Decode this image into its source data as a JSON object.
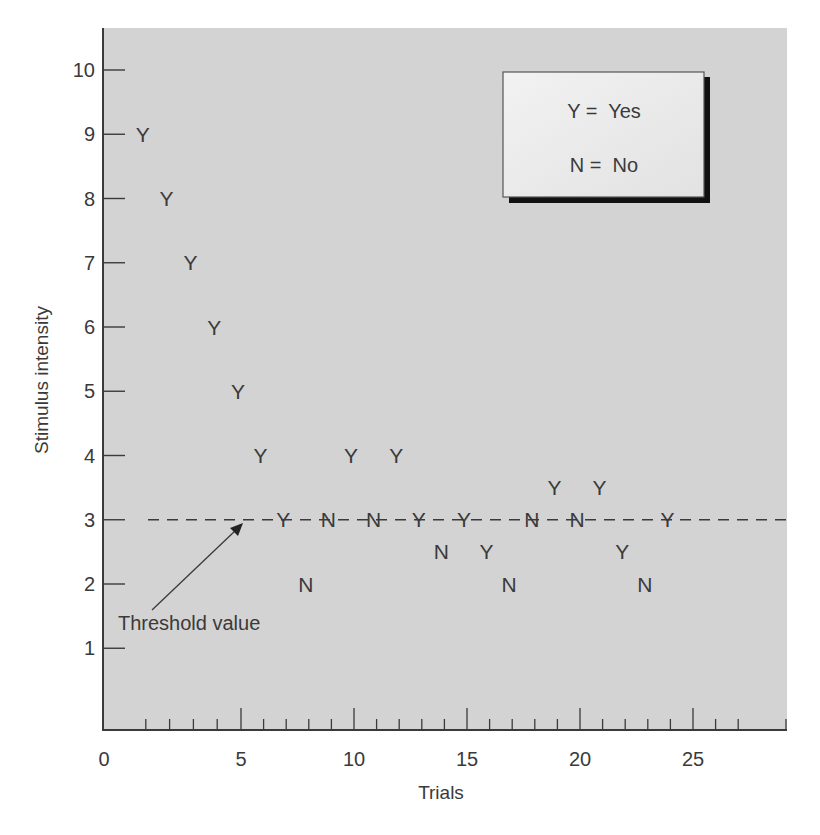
{
  "chart_data": {
    "type": "scatter",
    "title": "",
    "xlabel": "Trials",
    "ylabel": "Stimulus intensity",
    "xlim": [
      0,
      28
    ],
    "ylim": [
      0,
      10.6
    ],
    "grid": false,
    "x_major_ticks": [
      0,
      5,
      10,
      15,
      20,
      25
    ],
    "x_tick_labels": [
      "0",
      "5",
      "10",
      "15",
      "20",
      "25"
    ],
    "y_ticks": [
      1,
      2,
      3,
      4,
      5,
      6,
      7,
      8,
      9,
      10
    ],
    "y_tick_labels": [
      "1",
      "2",
      "3",
      "4",
      "5",
      "6",
      "7",
      "8",
      "9",
      "10"
    ],
    "legend": {
      "position": "upper right",
      "entries": [
        {
          "symbol": "Y",
          "text": "Y =  Yes"
        },
        {
          "symbol": "N",
          "text": "N =  No"
        }
      ]
    },
    "threshold": {
      "value": 3,
      "style": "dashed",
      "label": "Threshold value"
    },
    "points": [
      {
        "trial": 1,
        "intensity": 9,
        "response": "Y"
      },
      {
        "trial": 2,
        "intensity": 8,
        "response": "Y"
      },
      {
        "trial": 3,
        "intensity": 7,
        "response": "Y"
      },
      {
        "trial": 4,
        "intensity": 6,
        "response": "Y"
      },
      {
        "trial": 5,
        "intensity": 5,
        "response": "Y"
      },
      {
        "trial": 6,
        "intensity": 4,
        "response": "Y"
      },
      {
        "trial": 7,
        "intensity": 3,
        "response": "Y"
      },
      {
        "trial": 8,
        "intensity": 2,
        "response": "N"
      },
      {
        "trial": 9,
        "intensity": 3,
        "response": "N"
      },
      {
        "trial": 10,
        "intensity": 4,
        "response": "Y"
      },
      {
        "trial": 11,
        "intensity": 3,
        "response": "N"
      },
      {
        "trial": 12,
        "intensity": 4,
        "response": "Y"
      },
      {
        "trial": 13,
        "intensity": 3,
        "response": "Y"
      },
      {
        "trial": 14,
        "intensity": 2.5,
        "response": "N"
      },
      {
        "trial": 15,
        "intensity": 3,
        "response": "Y"
      },
      {
        "trial": 16,
        "intensity": 2.5,
        "response": "Y"
      },
      {
        "trial": 17,
        "intensity": 2,
        "response": "N"
      },
      {
        "trial": 18,
        "intensity": 3,
        "response": "N"
      },
      {
        "trial": 19,
        "intensity": 3.5,
        "response": "Y"
      },
      {
        "trial": 20,
        "intensity": 3,
        "response": "N"
      },
      {
        "trial": 21,
        "intensity": 3.5,
        "response": "Y"
      },
      {
        "trial": 22,
        "intensity": 2.5,
        "response": "Y"
      },
      {
        "trial": 23,
        "intensity": 2,
        "response": "N"
      },
      {
        "trial": 24,
        "intensity": 3,
        "response": "Y"
      }
    ]
  },
  "colors": {
    "plot_background": "#d3d3d3",
    "legend_background": "#ececec",
    "legend_shadow": "#111111",
    "ink": "#3a3a3a"
  }
}
